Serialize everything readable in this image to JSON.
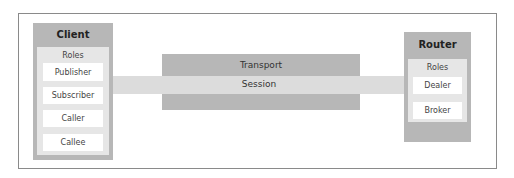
{
  "diagram": {
    "client": {
      "title": "Client",
      "roles_label": "Roles",
      "roles": [
        "Publisher",
        "Subscriber",
        "Caller",
        "Callee"
      ]
    },
    "router": {
      "title": "Router",
      "roles_label": "Roles",
      "roles": [
        "Dealer",
        "Broker"
      ]
    },
    "transport": {
      "label": "Transport"
    },
    "session": {
      "label": "Session"
    },
    "colors": {
      "entity": "#b7b7b7",
      "roles_area": "#e6e6e6",
      "role_box": "#ffffff",
      "session": "#dcdcdc",
      "transport": "#b7b7b7",
      "frame_border": "#8a8a8a"
    }
  }
}
